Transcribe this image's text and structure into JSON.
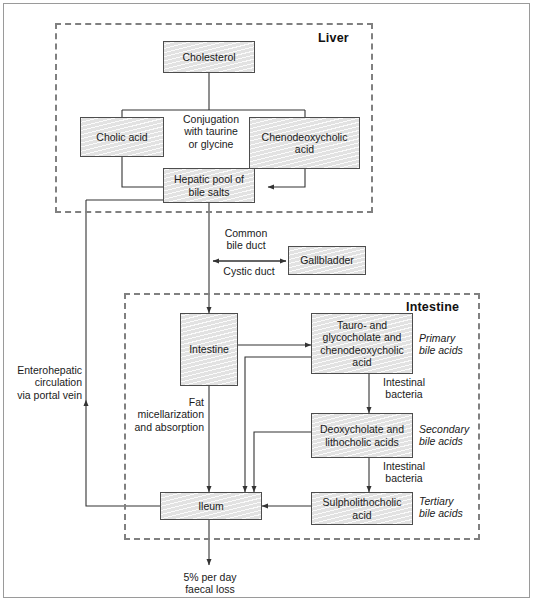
{
  "figure": {
    "compartments": [
      {
        "id": "liver",
        "label": "Liver"
      },
      {
        "id": "intestine",
        "label": "Intestine"
      }
    ]
  },
  "nodes": {
    "cholesterol": "Cholesterol",
    "cholic_acid": "Cholic acid",
    "chenodeoxycholic_acid": "Chenodeoxycholic\nacid",
    "hepatic_pool": "Hepatic pool\nof bile salts",
    "gallbladder": "Gallbladder",
    "intestine": "Intestine",
    "primary_bile_acids": "Tauro- and\nglycocholate and\nchenodeoxycholic\nacid",
    "secondary_bile_acids": "Deoxycholate\nand\nlithocholic acids",
    "tertiary_bile_acids": "Sulpholithocholic\nacid",
    "ileum": "Ileum"
  },
  "annotations": {
    "conjugation": "Conjugation\nwith taurine\nor glycine",
    "common_bile_duct": "Common\nbile duct",
    "cystic_duct": "Cystic duct",
    "enterohepatic": "Enterohepatic\ncirculation\nvia portal vein",
    "fat_micellarization": "Fat\nmicellarization\nand absorption",
    "intestinal_bacteria_1": "Intestinal\nbacteria",
    "intestinal_bacteria_2": "Intestinal\nbacteria",
    "primary_label": "Primary\nbile acids",
    "secondary_label": "Secondary\nbile acids",
    "tertiary_label": "Tertiary\nbile acids",
    "faecal_loss": "5% per day\nfaecal loss"
  },
  "colors": {
    "node_fill": "#e2e2e2",
    "node_border": "#4d4d4d",
    "compartment_border": "#808080",
    "line": "#333333",
    "text": "#1a1a1a",
    "frame": "#9a9a9a"
  }
}
